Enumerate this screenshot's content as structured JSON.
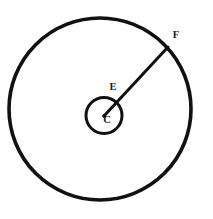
{
  "figure": {
    "background_color": "#ffffff",
    "stroke_color": "#111111",
    "canvas": {
      "width": 213,
      "height": 219
    },
    "shapes": {
      "outer_circle": {
        "name": "outer-circle",
        "cx": 100,
        "cy": 109,
        "r": 91,
        "stroke_width": 3.6,
        "fill": "none"
      },
      "inner_circle": {
        "name": "inner-circle",
        "cx": 104,
        "cy": 115.5,
        "r": 18,
        "stroke_width": 3.0,
        "fill": "none"
      },
      "radius_segment": {
        "name": "segment-CF",
        "x1": 104,
        "y1": 116,
        "x2": 168,
        "y2": 47,
        "stroke_width": 3.0
      },
      "center_dot": {
        "name": "center-point-C",
        "cx": 104,
        "cy": 116,
        "r": 1.8
      }
    },
    "labels": [
      {
        "id": "F",
        "text": "F",
        "x": 176,
        "y": 36
      },
      {
        "id": "E",
        "text": "E",
        "x": 113,
        "y": 88
      },
      {
        "id": "C",
        "text": "C",
        "x": 107,
        "y": 121
      }
    ]
  }
}
